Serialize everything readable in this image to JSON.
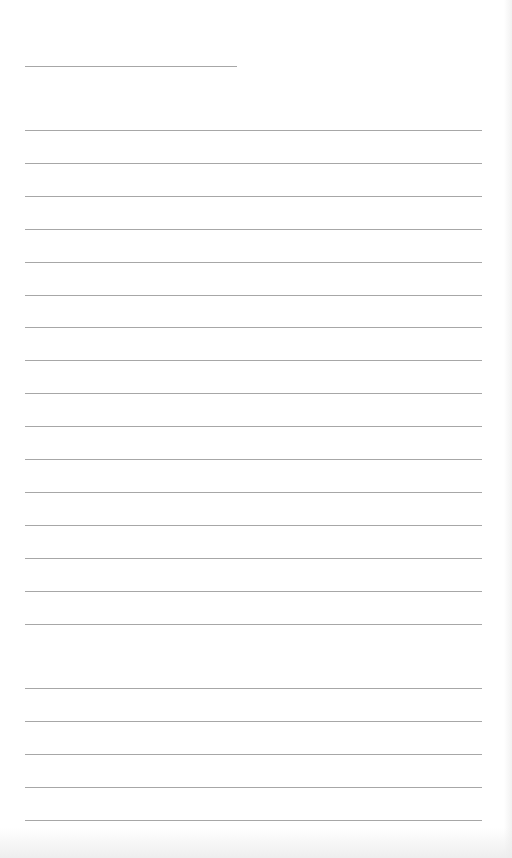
{
  "document": {
    "type": "blank lined paper",
    "background_color": "#ffffff",
    "line_color": "#8a8a8a",
    "header_line": {
      "x1": 25,
      "x2": 237,
      "y": 66
    },
    "ruled_lines": {
      "x1": 25,
      "x2": 482,
      "y_positions": [
        130,
        163,
        196,
        229,
        262,
        295,
        327,
        360,
        393,
        426,
        459,
        492,
        525,
        558,
        591,
        624,
        688,
        721,
        754,
        787,
        820
      ]
    }
  }
}
